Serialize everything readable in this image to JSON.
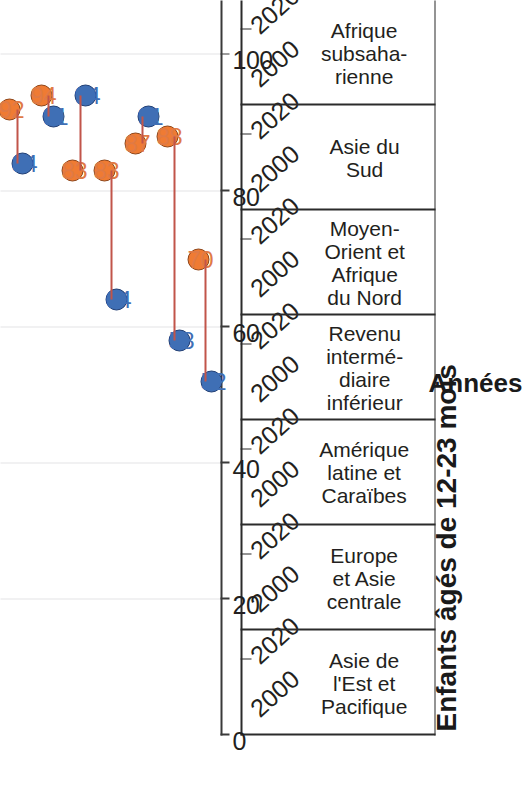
{
  "chart_data": {
    "type": "scatter",
    "title": "",
    "ylabel": "Enfants âgés de 12-23 mois",
    "xlabel": "Années",
    "ylim": [
      0,
      108
    ],
    "yticks": [
      0,
      20,
      40,
      60,
      80,
      100
    ],
    "ytick_labels": [
      "0",
      "20",
      "40",
      "60",
      "80",
      "100"
    ],
    "grid": "value-gridlines-only",
    "legend": "none",
    "orientation": "rotated-90-ccw",
    "year_labels": [
      "2000",
      "2020"
    ],
    "series": [
      {
        "name": "2000",
        "color": "#3f6fb5",
        "values": [
          84,
          91,
          94,
          64,
          91,
          58,
          52
        ]
      },
      {
        "name": "2020",
        "color": "#ef7b33",
        "values": [
          92,
          94,
          83,
          83,
          87,
          88,
          70
        ]
      }
    ],
    "categories": [
      "Asie de\nl'Est et\nPacifique",
      "Europe\net Asie\ncentrale",
      "Amérique\nlatine et\nCaraïbes",
      "Revenu\nintermé-\ndiaire\ninférieur",
      "Moyen-\nOrient et\nAfrique\ndu Nord",
      "Asie du\nSud",
      "Afrique\nsubsaha-\nrienne"
    ],
    "points": [
      {
        "category": "Asie de l'Est et Pacifique",
        "year": "2000",
        "value": 84,
        "label": "84"
      },
      {
        "category": "Asie de l'Est et Pacifique",
        "year": "2020",
        "value": 92,
        "label": "92"
      },
      {
        "category": "Europe et Asie centrale",
        "year": "2000",
        "value": 91,
        "label": "91"
      },
      {
        "category": "Europe et Asie centrale",
        "year": "2020",
        "value": 94,
        "label": "94"
      },
      {
        "category": "Amérique latine et Caraïbes",
        "year": "2000",
        "value": 94,
        "label": "94"
      },
      {
        "category": "Amérique latine et Caraïbes",
        "year": "2020",
        "value": 83,
        "label": "83"
      },
      {
        "category": "Revenu intermédiaire inférieur",
        "year": "2000",
        "value": 64,
        "label": "64"
      },
      {
        "category": "Revenu intermédiaire inférieur",
        "year": "2020",
        "value": 83,
        "label": "83"
      },
      {
        "category": "Moyen-Orient et Afrique du Nord",
        "year": "2000",
        "value": 91,
        "label": "91"
      },
      {
        "category": "Moyen-Orient et Afrique du Nord",
        "year": "2020",
        "value": 87,
        "label": "87"
      },
      {
        "category": "Asie du Sud",
        "year": "2000",
        "value": 58,
        "label": "58"
      },
      {
        "category": "Asie du Sud",
        "year": "2020",
        "value": 88,
        "label": "88"
      },
      {
        "category": "Afrique subsaharienne",
        "year": "2000",
        "value": 52,
        "label": "52"
      },
      {
        "category": "Afrique subsaharienne",
        "year": "2020",
        "value": 70,
        "label": "70"
      }
    ],
    "colors": {
      "year_2000": "#3f6fb5",
      "year_2000_stroke": "#1f3d73",
      "year_2020": "#ef7b33",
      "year_2020_stroke": "#8d4418",
      "connector": "#c1554a",
      "gridline": "#e3e3e5",
      "axis": "#2b2b2b",
      "text": "#231f20"
    }
  },
  "axes": {
    "value_axis_title": "Enfants âgés de 12-23 mois",
    "category_axis_title": "Années",
    "value_ticks": [
      "0",
      "20",
      "40",
      "60",
      "80",
      "100"
    ]
  },
  "categories": [
    {
      "id": "asie-est-pacifique",
      "name": "Asie de\nl'Est et\nPacifique",
      "years": [
        "2000",
        "2020"
      ]
    },
    {
      "id": "europe-asie-centrale",
      "name": "Europe\net Asie\ncentrale",
      "years": [
        "2000",
        "2020"
      ]
    },
    {
      "id": "amerique-latine",
      "name": "Amérique\nlatine et\nCaraïbes",
      "years": [
        "2000",
        "2020"
      ]
    },
    {
      "id": "revenu-intermediaire",
      "name": "Revenu\nintermé-\ndiaire\ninférieur",
      "years": [
        "2000",
        "2020"
      ]
    },
    {
      "id": "moyen-orient",
      "name": "Moyen-\nOrient et\nAfrique\ndu Nord",
      "years": [
        "2000",
        "2020"
      ]
    },
    {
      "id": "asie-du-sud",
      "name": "Asie du\nSud",
      "years": [
        "2000",
        "2020"
      ]
    },
    {
      "id": "afrique-subsaharienne",
      "name": "Afrique\nsubsaha-\nrienne",
      "years": [
        "2000",
        "2020"
      ]
    }
  ]
}
